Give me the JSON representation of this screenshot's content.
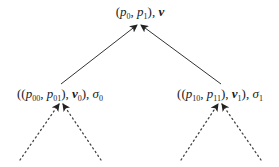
{
  "diagram": {
    "type": "tree",
    "root": {
      "label": "(p0, p1), v",
      "parts": {
        "open": "(",
        "p_a": "p",
        "p_a_sub": "0",
        "comma1": ", ",
        "p_b": "p",
        "p_b_sub": "1",
        "close": "), ",
        "v": "v",
        "v_sub": ""
      }
    },
    "children": [
      {
        "label": "((p00, p01), v0), σ0",
        "parts": {
          "open": "((",
          "p_a": "p",
          "p_a_sub": "00",
          "comma1": ", ",
          "p_b": "p",
          "p_b_sub": "01",
          "close": "), ",
          "v": "v",
          "v_sub": "0",
          "close2": "), ",
          "sigma": "σ",
          "sigma_sub": "0"
        },
        "edge_to_parent": "solid-arrow",
        "children_edges": "dotted-arrow"
      },
      {
        "label": "((p10, p11), v1), σ1",
        "parts": {
          "open": "((",
          "p_a": "p",
          "p_a_sub": "10",
          "comma1": ", ",
          "p_b": "p",
          "p_b_sub": "11",
          "close": "), ",
          "v": "v",
          "v_sub": "1",
          "close2": "), ",
          "sigma": "σ",
          "sigma_sub": "1"
        },
        "edge_to_parent": "solid-arrow",
        "children_edges": "dotted-arrow"
      }
    ],
    "colors": {
      "line": "#333333",
      "text": "#1a1a1a",
      "background": "#ffffff"
    }
  }
}
